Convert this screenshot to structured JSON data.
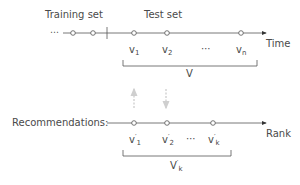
{
  "diagram": {
    "top": {
      "training_label": "Training set",
      "test_label": "Test set",
      "axis_label": "Time",
      "leading_ellipsis": "⋯",
      "items": [
        {
          "base": "v",
          "sub": "1"
        },
        {
          "base": "v",
          "sub": "2"
        },
        {
          "base": "⋯",
          "sub": ""
        },
        {
          "base": "v",
          "sub": "n"
        }
      ],
      "bracket_label": "V"
    },
    "bottom": {
      "row_label": "Recommendations:",
      "axis_label": "Rank",
      "items": [
        {
          "base": "v",
          "sup": "′",
          "sub": "1"
        },
        {
          "base": "v",
          "sup": "′",
          "sub": "2"
        },
        {
          "base": "⋯",
          "sup": "",
          "sub": ""
        },
        {
          "base": "v",
          "sup": "′",
          "sub": "k"
        }
      ],
      "bracket_label": {
        "base": "V",
        "sup": "′",
        "sub": "k"
      }
    },
    "colors": {
      "line": "#555555",
      "arrow_gray": "#cccccc",
      "text": "#4a4a4a"
    }
  }
}
